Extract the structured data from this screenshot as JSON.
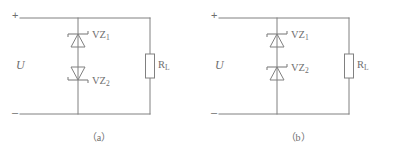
{
  "figure": {
    "width": 397,
    "height": 152,
    "background_color": "#ffffff",
    "line_color": "#808080",
    "text_color": "#6e6e6e"
  },
  "panels": [
    {
      "id": "a",
      "caption": "（a）",
      "source_label": "U",
      "terminal_positive": "+",
      "terminal_negative": "–",
      "load_label": "R",
      "load_subscript": "L",
      "devices": [
        {
          "name": "VZ",
          "subscript": "1",
          "label": "VZ1",
          "orientation": "apex-up",
          "cathode_side": "top"
        },
        {
          "name": "VZ",
          "subscript": "2",
          "label": "VZ2",
          "orientation": "apex-down",
          "cathode_side": "bottom"
        }
      ],
      "topology": "back-to-back series zener pair in parallel with load"
    },
    {
      "id": "b",
      "caption": "（b）",
      "source_label": "U",
      "terminal_positive": "+",
      "terminal_negative": "–",
      "load_label": "R",
      "load_subscript": "L",
      "devices": [
        {
          "name": "VZ",
          "subscript": "1",
          "label": "VZ1",
          "orientation": "apex-up",
          "cathode_side": "top"
        },
        {
          "name": "VZ",
          "subscript": "2",
          "label": "VZ2",
          "orientation": "apex-up",
          "cathode_side": "top"
        }
      ],
      "topology": "same-direction series zener pair in parallel with load"
    }
  ]
}
